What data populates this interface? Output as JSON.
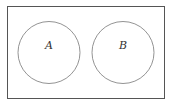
{
  "diagram": {
    "type": "venn",
    "universe_label": "",
    "sets": [
      {
        "label": "A"
      },
      {
        "label": "B"
      }
    ],
    "relationship": "disjoint",
    "stroke_color": "#555555",
    "background_color": "#ffffff"
  }
}
